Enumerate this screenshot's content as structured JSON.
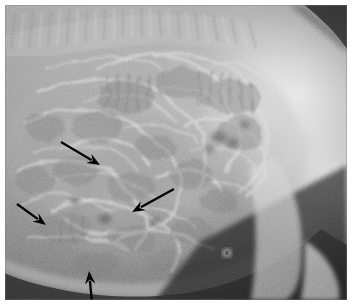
{
  "figure": {
    "kind": "radiograph",
    "modality": "X-ray",
    "view": "lateral abdominal radiograph",
    "caption": "",
    "border_color": "#ffffff",
    "plate_background": "#8a8a8a"
  },
  "image": {
    "width": 352,
    "height": 305,
    "plate_x": 5,
    "plate_y": 5,
    "plate_width": 342,
    "plate_height": 295,
    "orientation": "dorsal up, cranial left",
    "description": "Lateral abdominal radiograph showing numerous distended, gas- and fluid-filled intestinal loops filling the abdominal cavity, with the vertebral column along the dorsal margin and the bright hindlimb and pelvis at right."
  },
  "regions": [
    {
      "id": "vertebral-column",
      "label": "vertebral column",
      "tone": "#b4b4b4",
      "position": "dorsal margin, upper left to upper centre"
    },
    {
      "id": "intestinal-loops",
      "label": "distended intestinal loops",
      "tone": "#9a9a9a",
      "position": "central abdomen"
    },
    {
      "id": "gas-pockets",
      "label": "intraluminal gas",
      "tone": "#6d6d6d",
      "position": "mid and caudal abdomen"
    },
    {
      "id": "hindquarter",
      "label": "pelvis and hindlimb",
      "tone": "#f2f2f2",
      "position": "right third of plate"
    },
    {
      "id": "background-gas",
      "label": "extracorporeal background",
      "tone": "#1d1d1d",
      "position": "caudoventral, lower right"
    },
    {
      "id": "ventral-body-wall",
      "label": "ventral abdominal wall",
      "tone": "#cfcfcf",
      "position": "lower border of abdomen"
    },
    {
      "id": "corner-collimation",
      "label": "collimation shadow",
      "tone": "#1a1a1a",
      "position": "upper right corner"
    }
  ],
  "annotations": {
    "marker_color": "#050505",
    "count": 4,
    "arrows": [
      {
        "id": "arrow-1",
        "label": "arrow 1",
        "points_to": "dilated small intestinal loop, mid-abdomen",
        "direction": "down-right",
        "tail": [
          61,
          142
        ],
        "tip": [
          100,
          165
        ]
      },
      {
        "id": "arrow-2",
        "label": "arrow 2",
        "points_to": "dilated loop, caudoventral abdomen",
        "direction": "down-left",
        "tail": [
          174,
          189
        ],
        "tip": [
          132,
          212
        ]
      },
      {
        "id": "arrow-3",
        "label": "arrow 3",
        "points_to": "dilated loop, cranioventral abdomen",
        "direction": "down-right",
        "tail": [
          17,
          204
        ],
        "tip": [
          46,
          225
        ]
      },
      {
        "id": "arrow-4",
        "label": "arrow 4",
        "points_to": "ventral abdominal wall margin",
        "direction": "up",
        "tail": [
          92,
          303
        ],
        "tip": [
          89,
          271
        ]
      }
    ]
  },
  "text_overlays": []
}
